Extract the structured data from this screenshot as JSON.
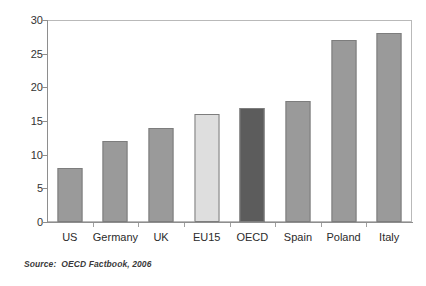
{
  "chart_data": {
    "type": "bar",
    "title": "",
    "subtitle": "",
    "xlabel": "",
    "ylabel": "",
    "categories": [
      "US",
      "Germany",
      "UK",
      "EU15",
      "OECD",
      "Spain",
      "Poland",
      "Italy"
    ],
    "values": [
      8,
      12,
      14,
      16,
      17,
      18,
      27,
      28
    ],
    "ylim": [
      0,
      30
    ],
    "yticks": [
      0,
      5,
      10,
      15,
      20,
      25,
      30
    ],
    "ytick_labels": [
      "0",
      "5",
      "10",
      "15",
      "20",
      "25",
      "30"
    ],
    "grid": false,
    "legend": null,
    "bar_colors": [
      "#9a9a9a",
      "#9a9a9a",
      "#9a9a9a",
      "#dedede",
      "#5c5c5c",
      "#9a9a9a",
      "#9a9a9a",
      "#9a9a9a"
    ],
    "bar_border_color": "#7d7d7d",
    "frame_color": "#b9b9b9",
    "axis_color": "#8e8e8e",
    "annotations": []
  },
  "source": {
    "text": "Source:  OECD Factbook, 2006"
  }
}
